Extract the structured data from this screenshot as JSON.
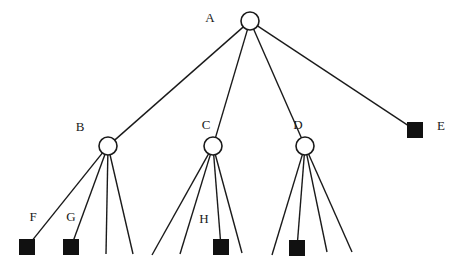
{
  "diagram": {
    "type": "tree-diagram",
    "title": "",
    "canvas": {
      "width": 468,
      "height": 271,
      "background": "#ffffff"
    },
    "style": {
      "line_color": "#1a1a1a",
      "line_width": 1.4,
      "circle_fill": "#ffffff",
      "circle_stroke": "#1a1a1a",
      "square_fill": "#111111",
      "square_stroke": "#111111",
      "label_color": "#1a1a1a",
      "label_font_size": 13
    },
    "nodes": [
      {
        "id": "A",
        "label": "A",
        "shape": "circle",
        "x": 250,
        "y": 21,
        "r": 9,
        "label_x": 210,
        "label_y": 19
      },
      {
        "id": "B",
        "label": "B",
        "shape": "circle",
        "x": 108,
        "y": 146,
        "r": 9,
        "label_x": 80,
        "label_y": 128
      },
      {
        "id": "C",
        "label": "C",
        "shape": "circle",
        "x": 213,
        "y": 146,
        "r": 9,
        "label_x": 206,
        "label_y": 126
      },
      {
        "id": "D",
        "label": "D",
        "shape": "circle",
        "x": 305,
        "y": 146,
        "r": 9,
        "label_x": 298,
        "label_y": 126
      },
      {
        "id": "E",
        "label": "E",
        "shape": "square",
        "x": 415,
        "y": 130,
        "size": 15,
        "label_x": 441,
        "label_y": 127
      },
      {
        "id": "F",
        "label": "F",
        "shape": "square",
        "x": 27,
        "y": 247,
        "size": 15,
        "label_x": 33,
        "label_y": 218
      },
      {
        "id": "G",
        "label": "G",
        "shape": "square",
        "x": 71,
        "y": 247,
        "size": 15,
        "label_x": 71,
        "label_y": 218
      },
      {
        "id": "H",
        "label": "H",
        "shape": "square",
        "x": 221,
        "y": 247,
        "size": 15,
        "label_x": 204,
        "label_y": 220
      },
      {
        "id": "I",
        "label": "",
        "shape": "square",
        "x": 297,
        "y": 248,
        "size": 15,
        "label_x": 0,
        "label_y": 0
      },
      {
        "id": "b3",
        "label": "",
        "shape": "none",
        "x": 106,
        "y": 254
      },
      {
        "id": "b4",
        "label": "",
        "shape": "none",
        "x": 133,
        "y": 254
      },
      {
        "id": "c1",
        "label": "",
        "shape": "none",
        "x": 152,
        "y": 255
      },
      {
        "id": "c2",
        "label": "",
        "shape": "none",
        "x": 180,
        "y": 254
      },
      {
        "id": "c4",
        "label": "",
        "shape": "none",
        "x": 242,
        "y": 253
      },
      {
        "id": "d1",
        "label": "",
        "shape": "none",
        "x": 272,
        "y": 255
      },
      {
        "id": "d3",
        "label": "",
        "shape": "none",
        "x": 327,
        "y": 252
      },
      {
        "id": "d4",
        "label": "",
        "shape": "none",
        "x": 352,
        "y": 252
      }
    ],
    "edges": [
      {
        "from": "A",
        "to": "B"
      },
      {
        "from": "A",
        "to": "C"
      },
      {
        "from": "A",
        "to": "D"
      },
      {
        "from": "A",
        "to": "E"
      },
      {
        "from": "B",
        "to": "F"
      },
      {
        "from": "B",
        "to": "G"
      },
      {
        "from": "B",
        "to": "b3"
      },
      {
        "from": "B",
        "to": "b4"
      },
      {
        "from": "C",
        "to": "c1"
      },
      {
        "from": "C",
        "to": "c2"
      },
      {
        "from": "C",
        "to": "H"
      },
      {
        "from": "C",
        "to": "c4"
      },
      {
        "from": "D",
        "to": "d1"
      },
      {
        "from": "D",
        "to": "I"
      },
      {
        "from": "D",
        "to": "d3"
      },
      {
        "from": "D",
        "to": "d4"
      }
    ]
  }
}
